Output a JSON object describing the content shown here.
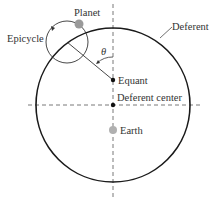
{
  "labels": {
    "planet": "Planet",
    "epicycle": "Epicycle",
    "deferent": "Deferent",
    "equant": "Equant",
    "deferent_center": "Deferent center",
    "earth": "Earth",
    "theta": "θ"
  },
  "colors": {
    "line": "#1a1a1a",
    "dash": "#555555",
    "planet_fill": "#9a9a9a",
    "earth_fill": "#b0b0b0"
  }
}
